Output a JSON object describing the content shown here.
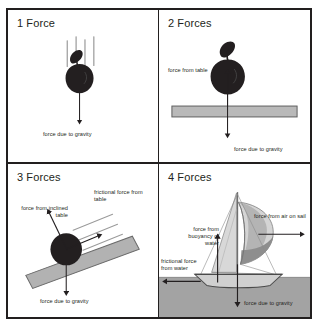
{
  "figure": {
    "background": "#ffffff",
    "border_color": "#221f1f"
  },
  "colors": {
    "ink": "#231f20",
    "arrow": "#231f20",
    "apple": "#231f20",
    "table_fill": "#b9b9b9",
    "table_stroke": "#5e5e5e",
    "ramp_fill": "#b2b2b2",
    "ramp_stroke": "#6a6a6a",
    "water_fill": "#a3a3a3",
    "water_stroke": "#6a6a6a",
    "sail_light": "#d8d8d8",
    "sail_mid": "#b4b4b4",
    "sail_dark": "#8e8e8e",
    "hull": "#d0d0d0",
    "motion_line": "#8a8a8a"
  },
  "panels": [
    {
      "id": "one-force",
      "title": "1 Force",
      "object": "apple",
      "forces": [
        {
          "name": "gravity",
          "label": "force due to gravity",
          "direction": "down"
        }
      ],
      "motion_lines": 4
    },
    {
      "id": "two-forces",
      "title": "2 Forces",
      "object": "apple-on-table",
      "forces": [
        {
          "name": "normal",
          "label": "force from table",
          "direction": "up"
        },
        {
          "name": "gravity",
          "label": "force due to gravity",
          "direction": "down"
        }
      ],
      "surface": "table"
    },
    {
      "id": "three-forces",
      "title": "3 Forces",
      "object": "ball-on-incline",
      "forces": [
        {
          "name": "normal",
          "label": "force from inclined table",
          "direction": "up-left"
        },
        {
          "name": "friction",
          "label": "frictional force from table",
          "direction": "up-right"
        },
        {
          "name": "gravity",
          "label": "force due to gravity",
          "direction": "down"
        }
      ],
      "surface": "inclined-table",
      "motion_lines": 3
    },
    {
      "id": "four-forces",
      "title": "4 Forces",
      "object": "sailboat",
      "forces": [
        {
          "name": "wind",
          "label": "force from air on sail",
          "direction": "right"
        },
        {
          "name": "buoyancy",
          "label": "force from buoyancy of water",
          "direction": "up"
        },
        {
          "name": "friction",
          "label": "frictional force from water",
          "direction": "left"
        },
        {
          "name": "gravity",
          "label": "force due to gravity",
          "direction": "down"
        }
      ],
      "surface": "water"
    }
  ],
  "labels": {
    "p1_gravity": "force due to gravity",
    "p2_table": "force from table",
    "p2_gravity": "force due to gravity",
    "p3_incline": "force from inclined table",
    "p3_friction": "frictional force from table",
    "p3_gravity": "force due to gravity",
    "p4_air": "force from air on sail",
    "p4_buoyancy": "force from buoyancy of water",
    "p4_friction": "frictional force from water",
    "p4_gravity": "force due to gravity"
  }
}
